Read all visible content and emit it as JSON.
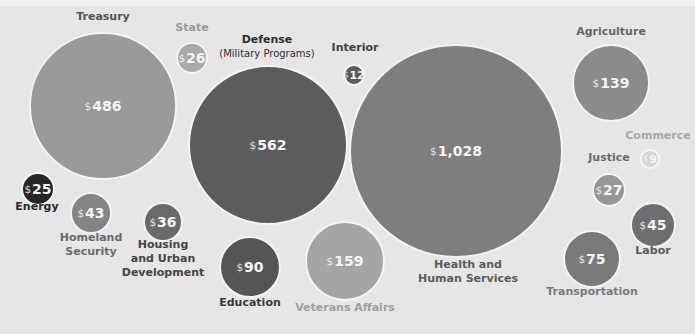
{
  "chart_data": {
    "type": "bubble",
    "title": "",
    "unit": "$ (billions)",
    "series": [
      {
        "name": "Treasury",
        "label": "Treasury",
        "value": 486,
        "display": "486",
        "cx": 103,
        "cy": 106,
        "r": 74,
        "color": "#9a9a9a",
        "label_color": "#555555",
        "label_x": 103,
        "label_y": 17
      },
      {
        "name": "State",
        "label": "State",
        "value": 26,
        "display": "26",
        "cx": 192,
        "cy": 58,
        "r": 16,
        "color": "#a9a9a9",
        "label_color": "#999999",
        "label_x": 192,
        "label_y": 28
      },
      {
        "name": "Defense",
        "label": "Defense",
        "sublabel": "(Military Programs)",
        "value": 562,
        "display": "562",
        "cx": 268,
        "cy": 145,
        "r": 80,
        "color": "#5c5c5c",
        "label_color": "#2e2e2e",
        "label_x": 267,
        "label_y": 40
      },
      {
        "name": "Interior",
        "label": "Interior",
        "value": 12,
        "display": "12",
        "cx": 354,
        "cy": 75,
        "r": 11,
        "color": "#5a5a5a",
        "label_color": "#404040",
        "label_x": 355,
        "label_y": 48
      },
      {
        "name": "Health and Human Services",
        "label": "Health and",
        "label2": "Human Services",
        "value": 1028,
        "display": "1,028",
        "cx": 456,
        "cy": 151,
        "r": 107,
        "color": "#7e7e7e",
        "label_color": "#5a5a5a",
        "label_x": 468,
        "label_y": 265
      },
      {
        "name": "Agriculture",
        "label": "Agriculture",
        "value": 139,
        "display": "139",
        "cx": 611,
        "cy": 83,
        "r": 39,
        "color": "#8b8b8b",
        "label_color": "#666666",
        "label_x": 611,
        "label_y": 32
      },
      {
        "name": "Commerce",
        "label": "Commerce",
        "value": 9,
        "display": "9",
        "cx": 650,
        "cy": 159,
        "r": 10,
        "color": "#d6d6d6",
        "label_color": "#a8a8a8",
        "label_x": 658,
        "label_y": 136
      },
      {
        "name": "Justice",
        "label": "Justice",
        "value": 27,
        "display": "27",
        "cx": 609,
        "cy": 190,
        "r": 17,
        "color": "#979797",
        "label_color": "#6a6a6a",
        "label_x": 609,
        "label_y": 158
      },
      {
        "name": "Labor",
        "label": "Labor",
        "value": 45,
        "display": "45",
        "cx": 653,
        "cy": 225,
        "r": 23,
        "color": "#6e6e6e",
        "label_color": "#5a5a5a",
        "label_x": 653,
        "label_y": 251
      },
      {
        "name": "Transportation",
        "label": "Transportation",
        "value": 75,
        "display": "75",
        "cx": 592,
        "cy": 259,
        "r": 29,
        "color": "#7a7a7a",
        "label_color": "#7a7a7a",
        "label_x": 592,
        "label_y": 292
      },
      {
        "name": "Veterans Affairs",
        "label": "Veterans Affairs",
        "value": 159,
        "display": "159",
        "cx": 345,
        "cy": 261,
        "r": 40,
        "color": "#a5a5a5",
        "label_color": "#a0a0a0",
        "label_x": 345,
        "label_y": 308
      },
      {
        "name": "Education",
        "label": "Education",
        "value": 90,
        "display": "90",
        "cx": 250,
        "cy": 267,
        "r": 31,
        "color": "#555555",
        "label_color": "#3a3a3a",
        "label_x": 250,
        "label_y": 303
      },
      {
        "name": "Housing and Urban Development",
        "label": "Housing",
        "label2": "and Urban",
        "label3": "Development",
        "value": 36,
        "display": "36",
        "cx": 163,
        "cy": 222,
        "r": 20,
        "color": "#6a6a6a",
        "label_color": "#444444",
        "label_x": 163,
        "label_y": 245
      },
      {
        "name": "Homeland Security",
        "label": "Homeland",
        "label2": "Security",
        "value": 43,
        "display": "43",
        "cx": 91,
        "cy": 213,
        "r": 21,
        "color": "#858585",
        "label_color": "#6a6a6a",
        "label_x": 91,
        "label_y": 238
      },
      {
        "name": "Energy",
        "label": "Energy",
        "value": 25,
        "display": "25",
        "cx": 38,
        "cy": 189,
        "r": 17,
        "color": "#262626",
        "label_color": "#2a2a2a",
        "label_x": 37,
        "label_y": 207
      }
    ],
    "currency_symbol": "$",
    "legend": "none",
    "grid": false
  }
}
